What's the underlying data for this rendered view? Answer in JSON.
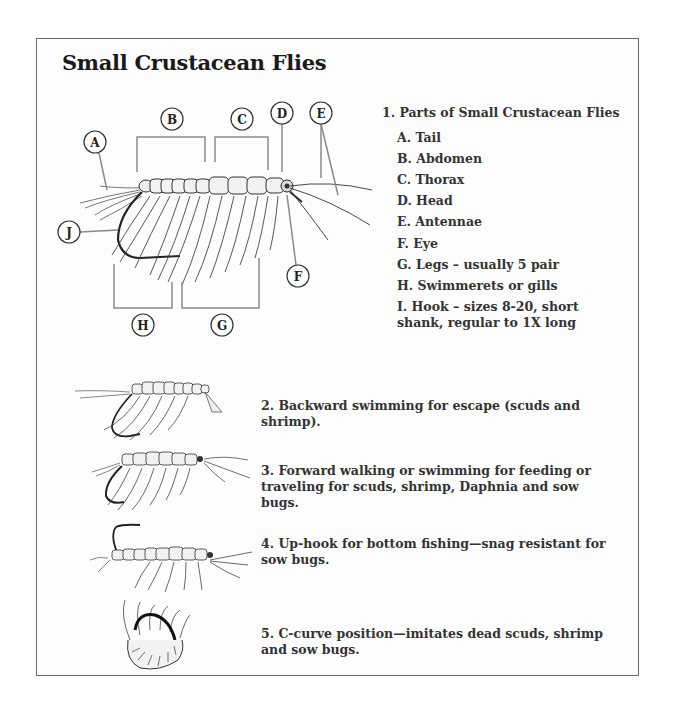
{
  "title": "Small Crustacean Flies",
  "parts_diagram": {
    "callout_labels": [
      "A",
      "B",
      "C",
      "D",
      "E",
      "F",
      "G",
      "H",
      "J"
    ]
  },
  "legend": {
    "header": "1. Parts of Small Crustacean Flies",
    "items": [
      {
        "letter": "A",
        "text": "A. Tail"
      },
      {
        "letter": "B",
        "text": "B. Abdomen"
      },
      {
        "letter": "C",
        "text": "C. Thorax"
      },
      {
        "letter": "D",
        "text": "D. Head"
      },
      {
        "letter": "E",
        "text": "E. Antennae"
      },
      {
        "letter": "F",
        "text": "F. Eye"
      },
      {
        "letter": "G",
        "text": "G. Legs – usually 5 pair"
      },
      {
        "letter": "H",
        "text": "H. Swimmerets or gills"
      },
      {
        "letter": "I",
        "text": "I. Hook – sizes 8-20, short"
      },
      {
        "letter": "I2",
        "text": "shank, regular to 1X long"
      }
    ]
  },
  "positions": [
    {
      "number": 2,
      "line1": "2. Backward swimming for escape (scuds and",
      "line2": "shrimp)."
    },
    {
      "number": 3,
      "line1": "3. Forward walking or swimming for feeding or",
      "line2": "traveling for scuds, shrimp, Daphnia and sow bugs."
    },
    {
      "number": 4,
      "line1": "4. Up-hook for bottom fishing—snag resistant for",
      "line2": "sow bugs."
    },
    {
      "number": 5,
      "line1": "5. C-curve position—imitates dead scuds, shrimp",
      "line2": "and sow bugs."
    }
  ],
  "colors": {
    "frame": "#6a6a6a",
    "text": "#333333",
    "title": "#1a1a1a",
    "bracket": "#8a8a8a"
  }
}
